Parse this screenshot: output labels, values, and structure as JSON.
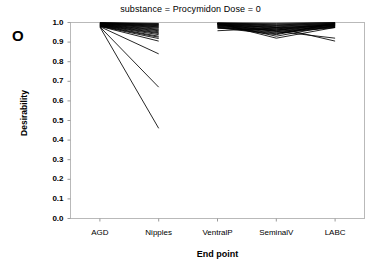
{
  "figure": {
    "panel_letter": "O",
    "title": "substance = Procymidon  Dose = 0",
    "xlabel": "End point",
    "ylabel": "Desirability"
  },
  "chart_data": {
    "type": "line",
    "title": "substance = Procymidon  Dose = 0",
    "subtitle": "",
    "panel_label": "O",
    "xlabel": "End point",
    "ylabel": "Desirability",
    "categories": [
      "AGD",
      "Nipples",
      "VentralP",
      "SeminalV",
      "LABC"
    ],
    "ylim": [
      0.0,
      1.0
    ],
    "yticks": [
      "0.0",
      "0.1",
      "0.2",
      "0.3",
      "0.4",
      "0.5",
      "0.6",
      "0.7",
      "0.8",
      "0.9",
      "1.0"
    ],
    "ytick_values": [
      0.0,
      0.1,
      0.2,
      0.3,
      0.4,
      0.5,
      0.6,
      0.7,
      0.8,
      0.9,
      1.0
    ],
    "grid": false,
    "legend": "none",
    "line_color": "#000000",
    "note": "Two disconnected segment groups: lines run AGD to Nipples, and separately VentralP to SeminalV to LABC.",
    "series": [
      {
        "name": "curve-01",
        "values": [
          1.0,
          0.995,
          null,
          null,
          null
        ]
      },
      {
        "name": "curve-02",
        "values": [
          0.998,
          0.992,
          null,
          null,
          null
        ]
      },
      {
        "name": "curve-03",
        "values": [
          0.997,
          0.99,
          null,
          null,
          null
        ]
      },
      {
        "name": "curve-04",
        "values": [
          0.996,
          0.987,
          null,
          null,
          null
        ]
      },
      {
        "name": "curve-05",
        "values": [
          0.995,
          0.984,
          null,
          null,
          null
        ]
      },
      {
        "name": "curve-06",
        "values": [
          0.994,
          0.981,
          null,
          null,
          null
        ]
      },
      {
        "name": "curve-07",
        "values": [
          0.993,
          0.978,
          null,
          null,
          null
        ]
      },
      {
        "name": "curve-08",
        "values": [
          0.992,
          0.975,
          null,
          null,
          null
        ]
      },
      {
        "name": "curve-09",
        "values": [
          0.991,
          0.971,
          null,
          null,
          null
        ]
      },
      {
        "name": "curve-10",
        "values": [
          0.99,
          0.966,
          null,
          null,
          null
        ]
      },
      {
        "name": "curve-11",
        "values": [
          0.989,
          0.962,
          null,
          null,
          null
        ]
      },
      {
        "name": "curve-12",
        "values": [
          0.988,
          0.958,
          null,
          null,
          null
        ]
      },
      {
        "name": "curve-13",
        "values": [
          0.987,
          0.953,
          null,
          null,
          null
        ]
      },
      {
        "name": "curve-14",
        "values": [
          0.986,
          0.948,
          null,
          null,
          null
        ]
      },
      {
        "name": "curve-15",
        "values": [
          0.985,
          0.944,
          null,
          null,
          null
        ]
      },
      {
        "name": "curve-16",
        "values": [
          0.984,
          0.938,
          null,
          null,
          null
        ]
      },
      {
        "name": "curve-17",
        "values": [
          0.983,
          0.93,
          null,
          null,
          null
        ]
      },
      {
        "name": "curve-18",
        "values": [
          0.982,
          0.925,
          null,
          null,
          null
        ]
      },
      {
        "name": "curve-19",
        "values": [
          0.981,
          0.918,
          null,
          null,
          null
        ]
      },
      {
        "name": "curve-20",
        "values": [
          0.98,
          0.905,
          null,
          null,
          null
        ]
      },
      {
        "name": "curve-21",
        "values": [
          0.979,
          0.84,
          null,
          null,
          null
        ]
      },
      {
        "name": "curve-22",
        "values": [
          0.978,
          0.67,
          null,
          null,
          null
        ]
      },
      {
        "name": "curve-23",
        "values": [
          0.977,
          0.46,
          null,
          null,
          null
        ]
      },
      {
        "name": "curve-24",
        "values": [
          null,
          null,
          0.998,
          0.996,
          1.0
        ]
      },
      {
        "name": "curve-25",
        "values": [
          null,
          null,
          0.997,
          0.992,
          0.998
        ]
      },
      {
        "name": "curve-26",
        "values": [
          null,
          null,
          0.996,
          0.988,
          0.996
        ]
      },
      {
        "name": "curve-27",
        "values": [
          null,
          null,
          0.995,
          0.985,
          0.994
        ]
      },
      {
        "name": "curve-28",
        "values": [
          null,
          null,
          0.994,
          0.982,
          0.992
        ]
      },
      {
        "name": "curve-29",
        "values": [
          null,
          null,
          0.993,
          0.978,
          0.99
        ]
      },
      {
        "name": "curve-30",
        "values": [
          null,
          null,
          0.992,
          0.974,
          0.988
        ]
      },
      {
        "name": "curve-31",
        "values": [
          null,
          null,
          0.99,
          0.97,
          0.986
        ]
      },
      {
        "name": "curve-32",
        "values": [
          null,
          null,
          0.988,
          0.966,
          0.984
        ]
      },
      {
        "name": "curve-33",
        "values": [
          null,
          null,
          0.986,
          0.962,
          0.982
        ]
      },
      {
        "name": "curve-34",
        "values": [
          null,
          null,
          0.984,
          0.958,
          0.98
        ]
      },
      {
        "name": "curve-35",
        "values": [
          null,
          null,
          0.982,
          0.955,
          0.978
        ]
      },
      {
        "name": "curve-36",
        "values": [
          null,
          null,
          0.98,
          0.95,
          0.976
        ]
      },
      {
        "name": "curve-37",
        "values": [
          null,
          null,
          0.978,
          0.946,
          0.974
        ]
      },
      {
        "name": "curve-38",
        "values": [
          null,
          null,
          0.976,
          0.942,
          0.996
        ]
      },
      {
        "name": "curve-39",
        "values": [
          null,
          null,
          0.974,
          0.938,
          0.994
        ]
      },
      {
        "name": "curve-40",
        "values": [
          null,
          null,
          0.995,
          0.93,
          0.985
        ]
      },
      {
        "name": "curve-41",
        "values": [
          null,
          null,
          0.992,
          0.955,
          0.92
        ]
      },
      {
        "name": "curve-42",
        "values": [
          null,
          null,
          0.988,
          0.975,
          0.905
        ]
      },
      {
        "name": "curve-43",
        "values": [
          null,
          null,
          0.97,
          0.962,
          0.992
        ]
      },
      {
        "name": "curve-44",
        "values": [
          null,
          null,
          0.958,
          0.972,
          0.988
        ]
      },
      {
        "name": "curve-45",
        "values": [
          null,
          null,
          0.996,
          0.92,
          0.975
        ]
      }
    ]
  }
}
